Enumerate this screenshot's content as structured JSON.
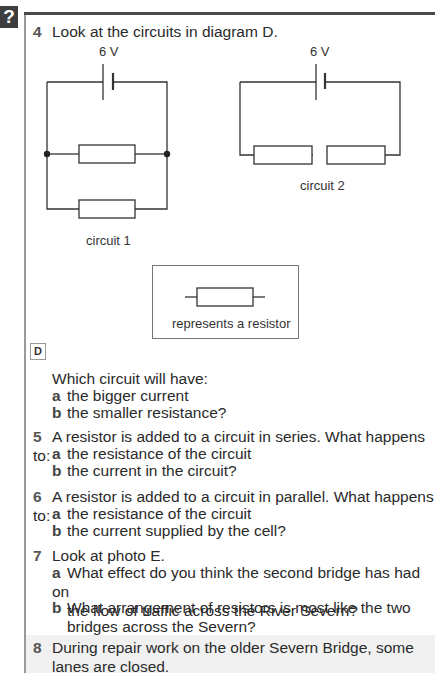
{
  "badge": {
    "symbol": "?"
  },
  "questions": [
    {
      "number": "4",
      "text": "Look at the circuits in diagram D."
    },
    {
      "number": "5",
      "text": "A resistor is added to a circuit in series. What happens to:",
      "parts": [
        {
          "letter": "a",
          "text": "the resistance of the circuit"
        },
        {
          "letter": "b",
          "text": "the current in the circuit?"
        }
      ]
    },
    {
      "number": "6",
      "text": "A resistor is added to a circuit in parallel. What happens to:",
      "parts": [
        {
          "letter": "a",
          "text": "the resistance of the circuit"
        },
        {
          "letter": "b",
          "text": "the current supplied by the cell?"
        }
      ]
    },
    {
      "number": "7",
      "text": "Look at photo E.",
      "parts": [
        {
          "letter": "a",
          "line1": "What effect do you think the second bridge has had on",
          "line2": "the flow of traffic across the River Severn?"
        },
        {
          "letter": "b",
          "line1": "What arrangement of resistors is most like the two",
          "line2": "bridges across the Severn?"
        }
      ]
    },
    {
      "number": "8",
      "line1": "During repair work on the older Severn Bridge, some",
      "line2": "lanes are closed."
    }
  ],
  "diagram": {
    "label": "D",
    "circuit1": {
      "voltage": "6 V",
      "caption": "circuit 1"
    },
    "circuit2": {
      "voltage": "6 V",
      "caption": "circuit 2"
    },
    "key": {
      "caption": "represents a resistor"
    }
  },
  "q4_followup": {
    "intro": "Which circuit will have:",
    "parts": [
      {
        "letter": "a",
        "text": "the bigger current"
      },
      {
        "letter": "b",
        "text": "the smaller resistance?"
      }
    ]
  }
}
